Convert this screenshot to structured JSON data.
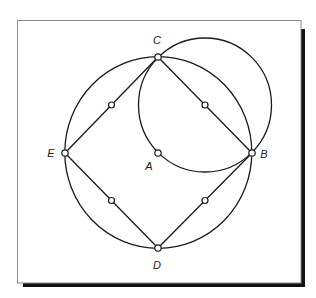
{
  "figure": {
    "frame": {
      "x": 17,
      "y": 20,
      "width": 284,
      "height": 263,
      "shadow_offset": 4
    },
    "colors": {
      "stroke": "#1a1a1a",
      "frame": "#8a8a8a",
      "shadow": "#111111",
      "background": "#ffffff"
    },
    "points": [
      {
        "id": "A",
        "label": "A",
        "x": 158,
        "y": 153,
        "label_x": 149,
        "label_y": 170
      },
      {
        "id": "B",
        "label": "B",
        "x": 252,
        "y": 153,
        "label_x": 264,
        "label_y": 158
      },
      {
        "id": "C",
        "label": "C",
        "x": 158,
        "y": 57,
        "label_x": 157,
        "label_y": 44
      },
      {
        "id": "D",
        "label": "D",
        "x": 158,
        "y": 248,
        "label_x": 157,
        "label_y": 269
      },
      {
        "id": "E",
        "label": "E",
        "x": 65,
        "y": 153,
        "label_x": 51,
        "label_y": 157
      }
    ],
    "midpoints": [
      {
        "between": "E-C",
        "x": 111.5,
        "y": 105
      },
      {
        "between": "C-B",
        "x": 205,
        "y": 105
      },
      {
        "between": "E-D",
        "x": 111.5,
        "y": 200.5
      },
      {
        "between": "B-D",
        "x": 205,
        "y": 200.5
      }
    ],
    "segments": [
      {
        "from": "E",
        "to": "C"
      },
      {
        "from": "C",
        "to": "B"
      },
      {
        "from": "B",
        "to": "D"
      },
      {
        "from": "D",
        "to": "E"
      }
    ],
    "circles": [
      {
        "name": "circle-centered-A",
        "cx": 158.3,
        "cy": 152.5,
        "rx": 93.5,
        "ry": 95.8
      },
      {
        "name": "circle-through-C-A-B",
        "cx": 205,
        "cy": 105,
        "rx": 66.5,
        "ry": 67
      }
    ]
  }
}
